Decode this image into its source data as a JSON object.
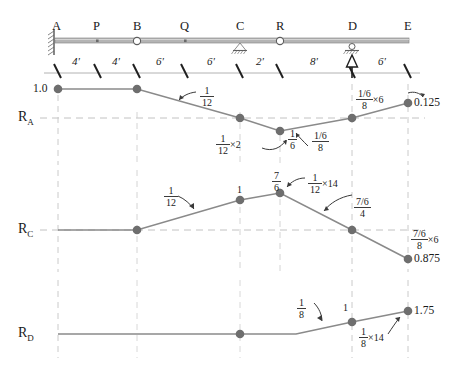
{
  "diagram": {
    "title_present": false,
    "beam": {
      "points": [
        {
          "name": "A",
          "x_ft": 0,
          "support": "fixed-wall"
        },
        {
          "name": "P",
          "x_ft": 4,
          "support": "point-marker"
        },
        {
          "name": "B",
          "x_ft": 8,
          "support": "hinge"
        },
        {
          "name": "Q",
          "x_ft": 14,
          "support": "point-marker"
        },
        {
          "name": "C",
          "x_ft": 20,
          "support": "pin-hatched"
        },
        {
          "name": "R",
          "x_ft": 22,
          "support": "hinge"
        },
        {
          "name": "D",
          "x_ft": 30,
          "support": "roller-hatched"
        },
        {
          "name": "E",
          "x_ft": 36,
          "support": "free-end"
        }
      ],
      "dimensions": [
        "4'",
        "4'",
        "6'",
        "6'",
        "2'",
        "8'",
        "6'"
      ],
      "load_arrow_at": "D"
    },
    "influence_lines": [
      {
        "label": "R",
        "subscript": "A",
        "ordinates": [
          {
            "at": "A",
            "value": 1.0,
            "text": "1.0"
          },
          {
            "at": "B",
            "value": 1.0,
            "text": ""
          },
          {
            "at": "C",
            "value": 0.0,
            "text": ""
          },
          {
            "at": "R",
            "value": -0.1667,
            "text": ""
          },
          {
            "at": "D",
            "value": 0.0,
            "text": ""
          },
          {
            "at": "E",
            "value": 0.125,
            "text": "0.125"
          }
        ],
        "annotations": [
          {
            "kind": "fraction",
            "num": "1",
            "den": "12",
            "suffix": "",
            "near": "B-C-slope"
          },
          {
            "kind": "fraction",
            "num": "1",
            "den": "12",
            "suffix": "×2",
            "near": "C-R-drop"
          },
          {
            "kind": "fraction",
            "num": "1",
            "den": "6",
            "suffix": "",
            "near": "R-ordinate"
          },
          {
            "kind": "fraction-stacked",
            "num": "1/6",
            "den": "8",
            "suffix": "",
            "near": "R-D-slope"
          },
          {
            "kind": "fraction-stacked",
            "num": "1/6",
            "den": "8",
            "suffix": "×6",
            "near": "D-E-rise"
          }
        ]
      },
      {
        "label": "R",
        "subscript": "C",
        "ordinates": [
          {
            "at": "A",
            "value": 0.0,
            "text": ""
          },
          {
            "at": "B",
            "value": 0.0,
            "text": ""
          },
          {
            "at": "Q",
            "value": 0.5,
            "text": "1"
          },
          {
            "at": "C",
            "value": 1.1667,
            "text": ""
          },
          {
            "at": "D",
            "value": 0.0,
            "text": ""
          },
          {
            "at": "E",
            "value": -0.875,
            "text": "0.875"
          }
        ],
        "annotations": [
          {
            "kind": "fraction",
            "num": "1",
            "den": "12",
            "suffix": "",
            "near": "B-C-rise"
          },
          {
            "kind": "plain",
            "text": "1",
            "near": "Q-ordinate"
          },
          {
            "kind": "fraction",
            "num": "7",
            "den": "6",
            "suffix": "",
            "near": "C-peak"
          },
          {
            "kind": "fraction",
            "num": "1",
            "den": "12",
            "suffix": "×14",
            "near": "C-peak-calc"
          },
          {
            "kind": "fraction-stacked",
            "num": "7/6",
            "den": "4",
            "suffix": "",
            "near": "C-D-fall"
          },
          {
            "kind": "fraction-stacked",
            "num": "7/6",
            "den": "8",
            "suffix": "×6",
            "near": "D-E-fall"
          }
        ]
      },
      {
        "label": "R",
        "subscript": "D",
        "ordinates": [
          {
            "at": "A",
            "value": 0.0,
            "text": ""
          },
          {
            "at": "C",
            "value": 0.0,
            "text": ""
          },
          {
            "at": "R",
            "value": 0.0,
            "text": ""
          },
          {
            "at": "D",
            "value": 1.0,
            "text": "1"
          },
          {
            "at": "E",
            "value": 1.75,
            "text": "1.75"
          }
        ],
        "annotations": [
          {
            "kind": "fraction",
            "num": "1",
            "den": "8",
            "suffix": "",
            "near": "R-D-rise"
          },
          {
            "kind": "plain",
            "text": "1",
            "near": "D-ordinate"
          },
          {
            "kind": "fraction",
            "num": "1",
            "den": "8",
            "suffix": "×14",
            "near": "D-E-rise"
          }
        ]
      }
    ],
    "colors": {
      "beam": "#a9a9a9",
      "line": "#7b7b7b",
      "node": "#6e6e6e",
      "grid": "#c9c9c9",
      "text": "#1a1a1a",
      "support": "#555555"
    }
  }
}
